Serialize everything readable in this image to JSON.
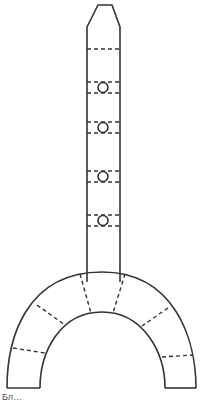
{
  "diagram": {
    "stroke_color": "#333333",
    "background": "#ffffff",
    "shaft": {
      "segment_lines_y": [
        49
      ],
      "ring_markers": [
        {
          "top_y": 82,
          "bottom_y": 93,
          "circle_y": 87
        },
        {
          "top_y": 122,
          "bottom_y": 132,
          "circle_y": 127
        },
        {
          "top_y": 171,
          "bottom_y": 181,
          "circle_y": 176
        },
        {
          "top_y": 215,
          "bottom_y": 225,
          "circle_y": 220
        }
      ]
    },
    "arch": {
      "segment_count": 6,
      "dashed_dividers": 6
    },
    "caption": "Бл…"
  }
}
